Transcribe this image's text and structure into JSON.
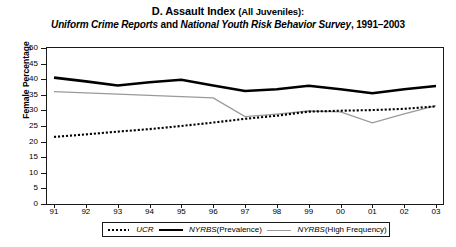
{
  "title": {
    "line1_lead": "D. Assault Index",
    "line1_paren": "(All Juveniles):",
    "line2_italic_a": "Uniform Crime Reports",
    "line2_roman_and": " and ",
    "line2_italic_b": "National Youth Risk Behavior Survey",
    "line2_roman_years": ", 1991–2003"
  },
  "axes": {
    "ylabel": "Female Percentage",
    "yticks": [
      "0",
      "5",
      "10",
      "15",
      "20",
      "25",
      "30",
      "35",
      "40",
      "45",
      "50"
    ],
    "xticks": [
      "91",
      "92",
      "93",
      "94",
      "95",
      "96",
      "97",
      "98",
      "99",
      "00",
      "01",
      "02",
      "03"
    ]
  },
  "legend": {
    "items": [
      {
        "style": "dotted",
        "name": "UCR",
        "sub": ""
      },
      {
        "style": "thick",
        "name": "NYRBS",
        "sub": " (Prevalence)"
      },
      {
        "style": "gray",
        "name": "NYRBS",
        "sub": " (High Frequency)"
      }
    ]
  },
  "colors": {
    "ucr": "#000000",
    "prevalence": "#000000",
    "high_frequency": "#9a9a9a",
    "axis": "#1a1a1a",
    "background": "#ffffff"
  },
  "chart_data": {
    "type": "line",
    "title": "D. Assault Index (All Juveniles): Uniform Crime Reports and National Youth Risk Behavior Survey, 1991–2003",
    "xlabel": "",
    "ylabel": "Female Percentage",
    "categories": [
      "91",
      "92",
      "93",
      "94",
      "95",
      "96",
      "97",
      "98",
      "99",
      "00",
      "01",
      "02",
      "03"
    ],
    "x": [
      1991,
      1992,
      1993,
      1994,
      1995,
      1996,
      1997,
      1998,
      1999,
      2000,
      2001,
      2002,
      2003
    ],
    "ylim": [
      0,
      50
    ],
    "ytick_step": 5,
    "grid": false,
    "legend_position": "bottom",
    "series": [
      {
        "name": "UCR",
        "style": "dotted",
        "color": "#000000",
        "values": [
          21.5,
          22.3,
          23.2,
          24.0,
          25.0,
          26.1,
          27.3,
          28.3,
          29.6,
          29.9,
          30.1,
          30.5,
          31.3
        ]
      },
      {
        "name": "NYRBS (Prevalence)",
        "style": "thick-solid",
        "color": "#000000",
        "values": [
          40.5,
          39.3,
          38.0,
          39.0,
          39.8,
          38.0,
          36.2,
          36.8,
          37.9,
          36.8,
          35.5,
          36.8,
          37.8
        ]
      },
      {
        "name": "NYRBS (High Frequency)",
        "style": "thin-solid",
        "color": "#9a9a9a",
        "values": [
          36.0,
          35.6,
          35.2,
          34.8,
          34.4,
          34.0,
          28.0,
          28.8,
          29.8,
          29.5,
          26.0,
          28.9,
          31.5
        ]
      }
    ]
  }
}
